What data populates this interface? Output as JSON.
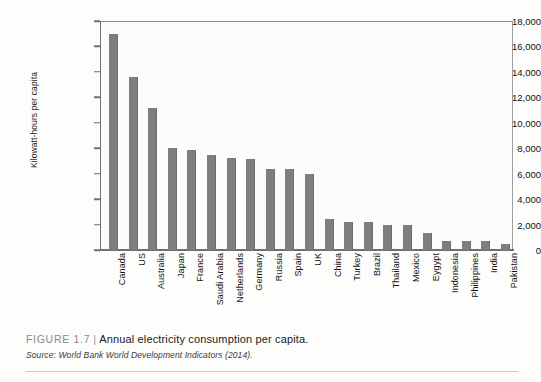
{
  "figure": {
    "caption_number": "FIGURE 1.7",
    "caption_separator": "|",
    "caption_title": "Annual electricity consumption per capita.",
    "source": "Source: World Bank World Development Indicators (2014)."
  },
  "chart_data": {
    "type": "bar",
    "title": "Annual electricity consumption per capita",
    "xlabel": "",
    "ylabel": "Kilowatt-hours per capita",
    "ylim": [
      0,
      18000
    ],
    "ytick_labels": [
      "18,000",
      "16,000",
      "14,000",
      "12,000",
      "10,000",
      "8,000",
      "6,000",
      "4,000",
      "2,000",
      "0"
    ],
    "ytick_values": [
      18000,
      16000,
      14000,
      12000,
      10000,
      8000,
      6000,
      4000,
      2000,
      0
    ],
    "grid": false,
    "legend": false,
    "bar_color": "#7e7e7e",
    "categories": [
      "Canada",
      "US",
      "Australia",
      "Japan",
      "France",
      "Saudi Arabia",
      "Netherlands",
      "Germany",
      "Russia",
      "Spain",
      "UK",
      "China",
      "Turkey",
      "Brazil",
      "Thailand",
      "Mexico",
      "Eygypt",
      "Indonesia",
      "Philippines",
      "India",
      "Pakistan"
    ],
    "values": [
      17000,
      13600,
      11200,
      8000,
      7850,
      7450,
      7200,
      7150,
      6400,
      6350,
      6000,
      2400,
      2200,
      2200,
      2000,
      1950,
      1300,
      700,
      700,
      700,
      450
    ]
  }
}
